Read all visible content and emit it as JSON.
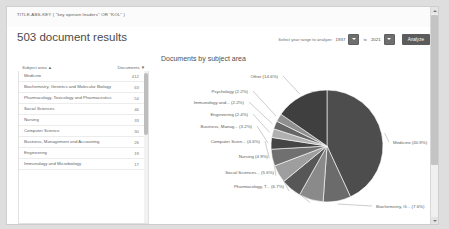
{
  "window": {
    "background_color": "#dedede",
    "canvas_color": "#ffffff"
  },
  "query_bar": {
    "query": "TITLE-ABS-KEY ( \"key opinion leaders\" OR \"KOL\" )"
  },
  "results_header": {
    "title": "503 document results",
    "year_range_label": "Select year range to analyze:",
    "year_from": "1937",
    "year_to_separator": "to",
    "year_to": "2021",
    "analyze_button": "Analyze",
    "analyze_button_color": "#5c5c5c",
    "from_dropdown_icon": "chevron-down-icon",
    "to_dropdown_icon": "chevron-down-icon"
  },
  "sidebar": {
    "column_subject": "Subject area",
    "column_documents": "Documents",
    "sort_asc_icon": "sort-ascending-caret",
    "sort_desc_icon": "sort-descending-caret",
    "rows": [
      {
        "subject": "Medicine",
        "documents": "412"
      },
      {
        "subject": "Biochemistry, Genetics and Molecular Biology",
        "documents": "63"
      },
      {
        "subject": "Pharmacology, Toxicology and Pharmaceutics",
        "documents": "54"
      },
      {
        "subject": "Social Sciences",
        "documents": "46"
      },
      {
        "subject": "Nursing",
        "documents": "33"
      },
      {
        "subject": "Computer Science",
        "documents": "30"
      },
      {
        "subject": "Business, Management and Accounting",
        "documents": "26"
      },
      {
        "subject": "Engineering",
        "documents": "19"
      },
      {
        "subject": "Immunology and Microbiology",
        "documents": "17"
      }
    ]
  },
  "chart_data": {
    "type": "pie",
    "title": "Documents by subject area",
    "categories": [
      "Medicine",
      "Biochemistry, G...",
      "Pharmacology, T...",
      "Social Sciences...",
      "Nursing",
      "Computer Scien...",
      "Business, Manag...",
      "Engineering",
      "Immunology and...",
      "Psychology",
      "Other"
    ],
    "values": [
      40.9,
      7.6,
      6.7,
      5.6,
      4.9,
      4.6,
      3.2,
      2.4,
      2.2,
      2.2,
      14.6
    ],
    "labels": [
      "Medicine (40.9%)",
      "Biochemistry, G... (7.6%)",
      "Pharmacology, T... (6.7%)",
      "Social Sciences... (5.6%)",
      "Nursing (4.9%)",
      "Computer Scien... (4.6%)",
      "Business, Manag... (3.2%)",
      "Engineering (2.4%)",
      "Immunology and... (2.2%)",
      "Psychology (2.2%)",
      "Other (14.6%)"
    ],
    "colors": [
      "#4d4d4d",
      "#6b6b6b",
      "#8a8a8a",
      "#575757",
      "#9e9e9e",
      "#707070",
      "#454545",
      "#b0b0b0",
      "#666666",
      "#8f8f8f",
      "#3f3f3f"
    ],
    "unit": "%",
    "legend": "labels-with-leader-lines",
    "grid": false
  },
  "scrollbars": {
    "page_up_icon": "scroll-up-arrow-icon",
    "page_down_icon": "scroll-down-arrow-icon"
  }
}
